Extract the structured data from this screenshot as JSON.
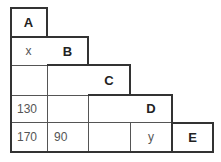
{
  "diagram": {
    "type": "triangular-distance-table",
    "headers": [
      "A",
      "B",
      "C",
      "D",
      "E"
    ],
    "rows": [
      [
        "A",
        "",
        "",
        "",
        ""
      ],
      [
        "x",
        "B",
        "",
        "",
        ""
      ],
      [
        "",
        "",
        "C",
        "",
        ""
      ],
      [
        "130",
        "",
        "",
        "D",
        ""
      ],
      [
        "170",
        "90",
        "",
        "y",
        "E"
      ]
    ]
  }
}
